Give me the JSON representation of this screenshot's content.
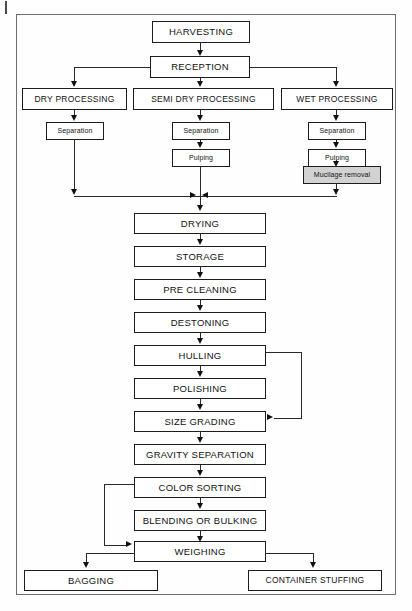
{
  "diagram": {
    "frame_color": "#6e6e6e",
    "box_border_color": "#1c1c1c",
    "shaded_fill": "#d2d2d2",
    "nodes": {
      "harvesting": "HARVESTING",
      "reception": "RECEPTION",
      "dry_processing": "DRY PROCESSING",
      "semi_dry_processing": "SEMI DRY PROCESSING",
      "wet_processing": "WET PROCESSING",
      "dry_separation": "Separation",
      "semi_separation": "Separation",
      "semi_pulping": "Pulping",
      "wet_separation": "Separation",
      "wet_pulping": "Pulping",
      "mucilage_removal": "Mucilage removal",
      "drying": "DRYING",
      "storage": "STORAGE",
      "pre_cleaning": "PRE CLEANING",
      "destoning": "DESTONING",
      "hulling": "HULLING",
      "polishing": "POLISHING",
      "size_grading": "SIZE GRADING",
      "gravity_separation": "GRAVITY SEPARATION",
      "color_sorting": "COLOR SORTING",
      "blending_or_bulking": "BLENDING OR BULKING",
      "weighing": "WEIGHING",
      "bagging": "BAGGING",
      "container_stuffing": "CONTAINER STUFFING"
    }
  }
}
